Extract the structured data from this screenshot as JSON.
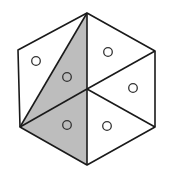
{
  "diagram": {
    "type": "hexagon-partition",
    "colors": {
      "stroke": "#1a1a1a",
      "shade": "#bdbdbd",
      "background": "#ffffff"
    },
    "vertices": {
      "top": [
        87,
        13
      ],
      "upper_right": [
        155,
        51
      ],
      "lower_right": [
        155,
        127
      ],
      "bottom": [
        87,
        165
      ],
      "lower_left": [
        20,
        127
      ],
      "upper_left": [
        18,
        50
      ],
      "center": [
        88,
        89
      ]
    },
    "circles": [
      {
        "x": 36,
        "y": 61,
        "shaded_region": false
      },
      {
        "x": 67,
        "y": 77,
        "shaded_region": true
      },
      {
        "x": 108,
        "y": 52,
        "shaded_region": false
      },
      {
        "x": 133,
        "y": 88,
        "shaded_region": false
      },
      {
        "x": 67,
        "y": 125,
        "shaded_region": true
      },
      {
        "x": 107,
        "y": 126,
        "shaded_region": false
      }
    ],
    "circle_count": 6,
    "shaded_circle_count": 2
  }
}
